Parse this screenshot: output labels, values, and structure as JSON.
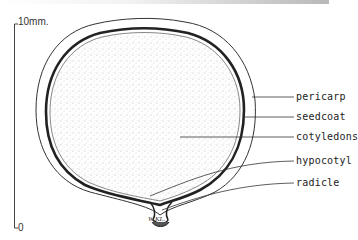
{
  "figure": {
    "scale_bar": {
      "top_label": "10mm.",
      "bottom_label": "0"
    },
    "labels": [
      {
        "id": "pericarp",
        "text": "pericarp"
      },
      {
        "id": "seedcoat",
        "text": "seedcoat"
      },
      {
        "id": "cotyledons",
        "text": "cotyledons"
      },
      {
        "id": "hypocotyl",
        "text": "hypocotyl"
      },
      {
        "id": "radicle",
        "text": "radicle"
      }
    ],
    "signature": "W.KL."
  }
}
